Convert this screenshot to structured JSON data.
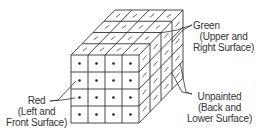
{
  "figure": {
    "type": "cube-painting-diagram",
    "grid_size": 4,
    "front_face_marker": "dot",
    "painted_face_marker": "dash"
  },
  "labels": {
    "green": {
      "title": "Green",
      "line2": "(Upper and",
      "line3": "Right Surface)"
    },
    "unpainted": {
      "title": "Unpainted",
      "line2": "(Back and",
      "line3": "Lower Surface)"
    },
    "red": {
      "title": "Red",
      "line2": "(Left and",
      "line3": "Front Surface)"
    }
  },
  "colors": {
    "line": "#333333",
    "text": "#333333",
    "background": "#ffffff"
  }
}
